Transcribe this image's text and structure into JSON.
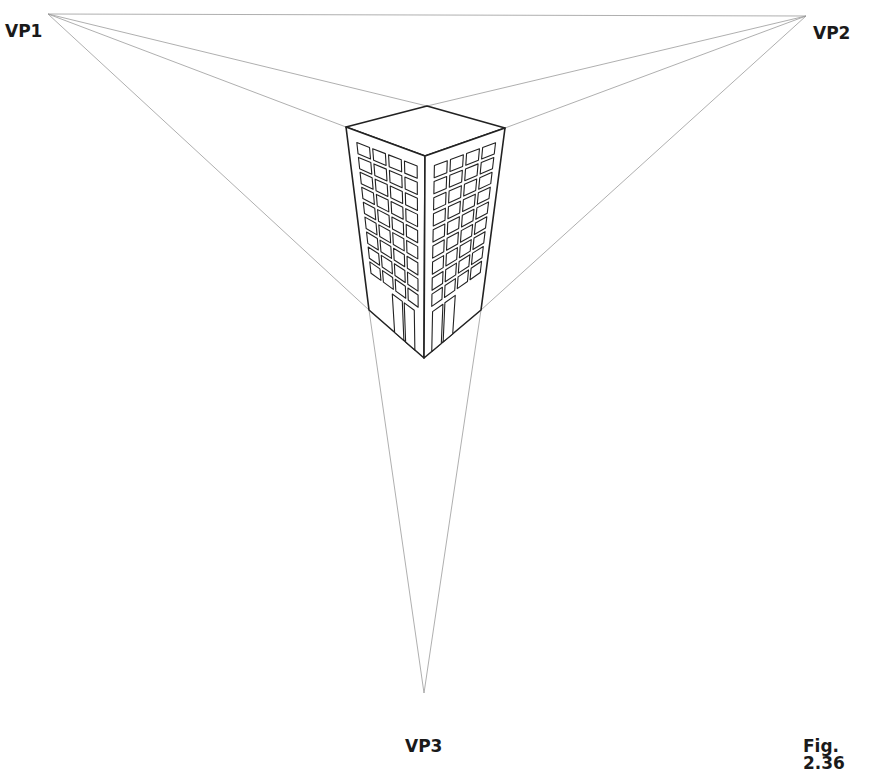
{
  "labels": {
    "vp1": "VP1",
    "vp2": "VP2",
    "vp3": "VP3",
    "figure": "Fig. 2.36"
  },
  "colors": {
    "construction_line": "#9a9a9a",
    "building_line": "#222222",
    "text": "#1a1a1a"
  },
  "vanishing_points": {
    "vp1": [
      48,
      14
    ],
    "vp2": [
      806,
      16
    ],
    "vp3": [
      424,
      693
    ]
  },
  "building": {
    "top": [
      427,
      106
    ],
    "left_top": [
      346,
      127
    ],
    "right_top": [
      505,
      128
    ],
    "front_top": [
      425,
      156
    ],
    "left_bottom": [
      369,
      310
    ],
    "right_bottom": [
      481,
      310
    ],
    "front_bottom": [
      424,
      358
    ],
    "window_columns": 4,
    "window_rows": 9,
    "doors_per_face": 2
  }
}
